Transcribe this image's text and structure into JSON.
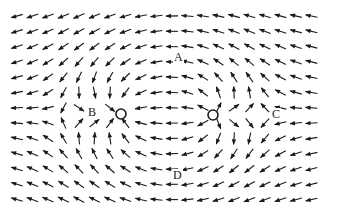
{
  "diagram": {
    "type": "vector_field",
    "width": 337,
    "height": 221,
    "background": "#ffffff",
    "arrow_color": "#1a1a1a",
    "grid": {
      "x_start": 17,
      "x_step": 15.5,
      "cols": 20,
      "y_start": 16,
      "y_step": 15.3,
      "rows": 13,
      "arrow_length": 12
    },
    "points": [
      {
        "id": "sink",
        "name": "left-circle",
        "x": 121,
        "y": 114,
        "r": 5,
        "kind": "sink",
        "strength": 1.0
      },
      {
        "id": "source",
        "name": "right-circle",
        "x": 213,
        "y": 115,
        "r": 5,
        "kind": "source",
        "strength": 0.9
      }
    ],
    "background_flow": {
      "dx": -0.012,
      "dy": 0
    },
    "labels": [
      {
        "id": "A",
        "text": "A",
        "x": 173,
        "y": 51
      },
      {
        "id": "B",
        "text": "B",
        "x": 87,
        "y": 106
      },
      {
        "id": "C",
        "text": "C",
        "x": 271,
        "y": 108
      },
      {
        "id": "D",
        "text": "D",
        "x": 172,
        "y": 169
      }
    ]
  }
}
